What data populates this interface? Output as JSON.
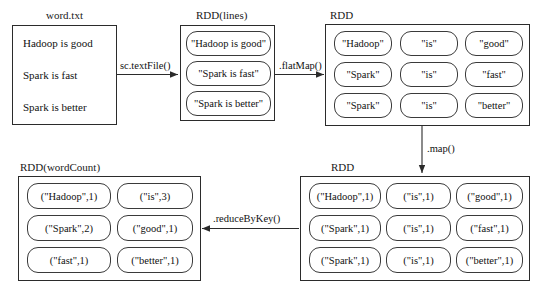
{
  "diagram": {
    "stroke_color": "#2b2b2b",
    "background_color": "#ffffff"
  },
  "nodes": {
    "source_file": {
      "caption": "word.txt",
      "lines": [
        "Hadoop is good",
        "Spark is fast",
        "Spark is better"
      ]
    },
    "rdd_lines": {
      "caption": "RDD(lines)",
      "items": [
        "\"Hadoop is good\"",
        "\"Spark is fast\"",
        "\"Spark is better\""
      ]
    },
    "rdd_words": {
      "caption": "RDD",
      "rows": [
        [
          "\"Hadoop\"",
          "\"is\"",
          "\"good\""
        ],
        [
          "\"Spark\"",
          "\"is\"",
          "\"fast\""
        ],
        [
          "\"Spark\"",
          "\"is\"",
          "\"better\""
        ]
      ]
    },
    "rdd_pairs": {
      "caption": "RDD",
      "rows": [
        [
          "(\"Hadoop\",1)",
          "(\"is\",1)",
          "(\"good\",1)"
        ],
        [
          "(\"Spark\",1)",
          "(\"is\",1)",
          "(\"fast\",1)"
        ],
        [
          "(\"Spark\",1)",
          "(\"is\",1)",
          "(\"better\",1)"
        ]
      ]
    },
    "rdd_wordcount": {
      "caption": "RDD(wordCount)",
      "rows": [
        [
          "(\"Hadoop\",1)",
          "(\"is\",3)"
        ],
        [
          "(\"Spark\",2)",
          "(\"good\",1)"
        ],
        [
          "(\"fast\",1)",
          "(\"better\",1)"
        ]
      ]
    }
  },
  "edges": {
    "text_file": "sc.textFile()",
    "flat_map": ".flatMap()",
    "map": ".map()",
    "reduce_by_key": ".reduceByKey()"
  }
}
